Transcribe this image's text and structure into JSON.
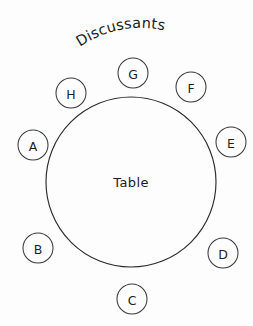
{
  "diagram": {
    "title": "Discussants",
    "center_label": "Table",
    "background_color": "#fdfdfd",
    "stroke_color": "#2b2b2b",
    "text_color": "#1c1c1c",
    "seats": [
      {
        "id": "seat-a",
        "label": "A",
        "cx": 33,
        "cy": 145,
        "r": 15
      },
      {
        "id": "seat-b",
        "label": "B",
        "cx": 38,
        "cy": 248,
        "r": 15
      },
      {
        "id": "seat-c",
        "label": "C",
        "cx": 132,
        "cy": 299,
        "r": 15
      },
      {
        "id": "seat-d",
        "label": "D",
        "cx": 223,
        "cy": 253,
        "r": 15
      },
      {
        "id": "seat-e",
        "label": "E",
        "cx": 231,
        "cy": 142,
        "r": 15
      },
      {
        "id": "seat-f",
        "label": "F",
        "cx": 191,
        "cy": 87,
        "r": 15
      },
      {
        "id": "seat-g",
        "label": "G",
        "cx": 133,
        "cy": 73,
        "r": 15
      },
      {
        "id": "seat-h",
        "label": "H",
        "cx": 71,
        "cy": 93,
        "r": 15
      }
    ],
    "table": {
      "cx": 131,
      "cy": 182,
      "r": 85
    }
  }
}
